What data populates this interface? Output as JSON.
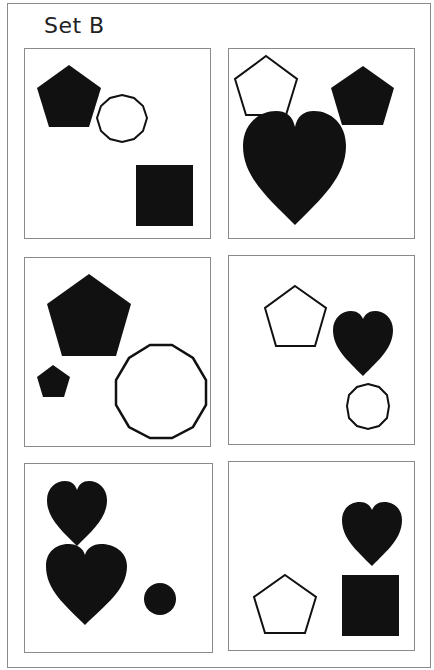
{
  "title": "Set B",
  "colors": {
    "fill": "#111111",
    "stroke": "#111111",
    "border": "#8a8a8a",
    "background": "#ffffff"
  },
  "panels": [
    {
      "id": 1,
      "row": 1,
      "col": 1,
      "shapes": [
        {
          "type": "pentagon",
          "style": "filled",
          "size": "medium"
        },
        {
          "type": "circle",
          "style": "outline",
          "size": "small"
        },
        {
          "type": "square",
          "style": "filled",
          "size": "medium"
        }
      ]
    },
    {
      "id": 2,
      "row": 1,
      "col": 2,
      "shapes": [
        {
          "type": "pentagon",
          "style": "outline",
          "size": "medium"
        },
        {
          "type": "pentagon",
          "style": "filled",
          "size": "medium"
        },
        {
          "type": "heart",
          "style": "filled",
          "size": "large"
        }
      ]
    },
    {
      "id": 3,
      "row": 2,
      "col": 1,
      "shapes": [
        {
          "type": "pentagon",
          "style": "filled",
          "size": "large"
        },
        {
          "type": "pentagon",
          "style": "filled",
          "size": "small"
        },
        {
          "type": "circle",
          "style": "outline",
          "size": "large"
        }
      ]
    },
    {
      "id": 4,
      "row": 2,
      "col": 2,
      "shapes": [
        {
          "type": "pentagon",
          "style": "outline",
          "size": "medium"
        },
        {
          "type": "heart",
          "style": "filled",
          "size": "medium"
        },
        {
          "type": "circle",
          "style": "outline",
          "size": "small"
        }
      ]
    },
    {
      "id": 5,
      "row": 3,
      "col": 1,
      "shapes": [
        {
          "type": "heart",
          "style": "filled",
          "size": "medium"
        },
        {
          "type": "heart",
          "style": "filled",
          "size": "large"
        },
        {
          "type": "circle",
          "style": "filled",
          "size": "small"
        }
      ]
    },
    {
      "id": 6,
      "row": 3,
      "col": 2,
      "shapes": [
        {
          "type": "heart",
          "style": "filled",
          "size": "medium"
        },
        {
          "type": "pentagon",
          "style": "outline",
          "size": "medium"
        },
        {
          "type": "square",
          "style": "filled",
          "size": "medium"
        }
      ]
    }
  ]
}
